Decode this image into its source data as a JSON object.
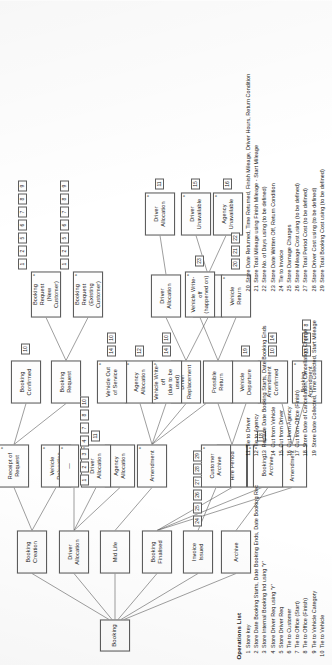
{
  "diagram": {
    "root": {
      "label": "Booking"
    },
    "nodes": [
      {
        "id": "booking",
        "label": "Booking",
        "star": false
      },
      {
        "id": "booking-creation",
        "label": "Booking\nCreation",
        "star": false
      },
      {
        "id": "mid-life",
        "label": "Mid Life",
        "star": false
      },
      {
        "id": "booking-finalised",
        "label": "Booking\nFinalised",
        "star": false
      },
      {
        "id": "invoice-issued",
        "label": "Invoice\nIssued",
        "star": false
      },
      {
        "id": "archive",
        "label": "Archive",
        "star": false
      },
      {
        "id": "vehicle-relocation",
        "label": "Vehicle\nRelocation",
        "star": true
      },
      {
        "id": "receipt-of-request",
        "label": "Receipt of\nRequest",
        "star": true
      },
      {
        "id": "booking-request",
        "label": "Booking\nRequest",
        "star": false
      },
      {
        "id": "booking-confirmed",
        "label": "Booking\nConfirmed",
        "star": false
      },
      {
        "id": "booking-request-new",
        "label": "Booking Request\n(New Customer)",
        "star": true
      },
      {
        "id": "booking-request-exist",
        "label": "Booking Request\n(Existing Customer)",
        "star": true
      },
      {
        "id": "agency-allocation-top",
        "label": "Agency\nAllocation",
        "star": true
      },
      {
        "id": "driver-allocation-top",
        "label": "Driver\nAllocation",
        "star": false
      },
      {
        "id": "driver-allocation-1",
        "label": "Driver\nAllocation",
        "star": true
      },
      {
        "id": "dash-node",
        "label": "—",
        "star": true
      },
      {
        "id": "agency-allocation-2",
        "label": "Agency\nAllocation",
        "star": true
      },
      {
        "id": "driver-replacement",
        "label": "Driver\nReplacement",
        "star": true
      },
      {
        "id": "driver-allocation-3",
        "label": "Driver\nAllocation",
        "star": false
      },
      {
        "id": "driver-allocation-4",
        "label": "Driver\nAllocation",
        "star": true
      },
      {
        "id": "driver-unavailable-1",
        "label": "Driver\nUnavailable",
        "star": false
      },
      {
        "id": "driver-unavailable-2",
        "label": "Driver\nUnavailable",
        "star": true
      },
      {
        "id": "agency-unavailable",
        "label": "Agency\nUnavailable",
        "star": true
      },
      {
        "id": "amendment-mid",
        "label": "Amendment",
        "star": true
      },
      {
        "id": "vehicle-writeoff-due",
        "label": "Vehicle Write-off\n(due to be used)",
        "star": true
      },
      {
        "id": "vehicle-out-service",
        "label": "Vehicle Out\nof Service",
        "star": true
      },
      {
        "id": "booking-cancellation",
        "label": "Booking\nCancellation",
        "star": true
      },
      {
        "id": "amendment-fin",
        "label": "Amendment",
        "star": true
      },
      {
        "id": "booking-amendment",
        "label": "Booking\nAmendment",
        "star": true
      },
      {
        "id": "amendment-confirmed",
        "label": "Amendment\nConfirmed",
        "star": false
      },
      {
        "id": "hire-period",
        "label": "Hire Period",
        "star": true
      },
      {
        "id": "vehicle-departure",
        "label": "Vehicle\nDeparture",
        "star": false
      },
      {
        "id": "possible-return",
        "label": "Possible\nReturn",
        "star": false
      },
      {
        "id": "vehicle-return",
        "label": "Vehicle\nReturn",
        "star": true
      },
      {
        "id": "vehicle-writeoff-happened",
        "label": "Vehicle Write-off\n(happened on)",
        "star": true
      },
      {
        "id": "customer-archive",
        "label": "Customer\nArchive",
        "star": true
      },
      {
        "id": "booking-archive",
        "label": "Booking\nArchive",
        "star": true
      }
    ],
    "operation_refs": {
      "vehicle-relocation": [
        "1",
        "2",
        "3",
        "4",
        "7",
        "8",
        "10"
      ],
      "booking-request-new": [
        "1",
        "2",
        "5",
        "6",
        "7",
        "8",
        "9"
      ],
      "booking-request-exist": [
        "1",
        "2",
        "5",
        "6",
        "7",
        "8",
        "9"
      ],
      "booking-confirmed": [
        "10"
      ],
      "driver-allocation-1": [
        "11"
      ],
      "agency-allocation-2": [
        "12"
      ],
      "driver-allocation-4": [
        "11"
      ],
      "driver-unavailable-2": [
        "15"
      ],
      "agency-unavailable": [
        "16"
      ],
      "vehicle-writeoff-due": [
        "14",
        "10"
      ],
      "vehicle-out-service": [
        "14",
        "10"
      ],
      "booking-cancellation": [
        "18"
      ],
      "booking-amendment": [
        "13",
        "17",
        "8"
      ],
      "amendment-confirmed": [
        "10",
        "14"
      ],
      "vehicle-departure": [
        "19"
      ],
      "vehicle-return": [
        "20",
        "21",
        "22"
      ],
      "vehicle-writeoff-happened": [
        "23"
      ],
      "invoice-issued": [
        "24",
        "25",
        "26",
        "27",
        "28",
        "29"
      ]
    }
  },
  "operations": {
    "title": "Operations List",
    "items": [
      {
        "num": "1",
        "text": "Store key"
      },
      {
        "num": "2",
        "text": "Store Date Booking Starts, Date Booking Ends, Date Booking Rec"
      },
      {
        "num": "3",
        "text": "Store Internal Booking Ind using 'Y'"
      },
      {
        "num": "4",
        "text": "Store Driver Req using 'Y'"
      },
      {
        "num": "5",
        "text": "Store Driver Req"
      },
      {
        "num": "6",
        "text": "Tie to Customer"
      },
      {
        "num": "7",
        "text": "Tie to Office (Start)"
      },
      {
        "num": "8",
        "text": "Tie to Office (Finish)"
      },
      {
        "num": "9",
        "text": "Tie to Vehicle Category"
      },
      {
        "num": "10",
        "text": "Tie to Vehicle"
      },
      {
        "num": "11",
        "text": "Tie to Driver"
      },
      {
        "num": "12",
        "text": "Tie to Agency"
      },
      {
        "num": "13",
        "text": "Replace Date Booking Starts, Date Booking Ends"
      },
      {
        "num": "14",
        "text": "Cut from Vehicle"
      },
      {
        "num": "15",
        "text": "Cut from Driver"
      },
      {
        "num": "16",
        "text": "Cut from Agency"
      },
      {
        "num": "17",
        "text": "Cut from Office (Finish)"
      },
      {
        "num": "18",
        "text": "Store Date of Cancellation, Cancellation Charge"
      },
      {
        "num": "19",
        "text": "Store Date Collected, Time Collected, Start Mileage"
      },
      {
        "num": "20",
        "text": "Store Date Returned, Time Returned, Finish Mileage, Driver Hours, Return Condition"
      },
      {
        "num": "21",
        "text": "Store Total Mileage using Finish Mileage - Start Mileage"
      },
      {
        "num": "22",
        "text": "Store No. of Days using (to be defined)"
      },
      {
        "num": "23",
        "text": "Store Date Written Off, Return Condition"
      },
      {
        "num": "24",
        "text": "Tie to Invoice"
      },
      {
        "num": "25",
        "text": "Store Damage Charges"
      },
      {
        "num": "26",
        "text": "Store Mileage Cost using (to be defined)"
      },
      {
        "num": "27",
        "text": "Store Total Period Cost (to be defined)"
      },
      {
        "num": "28",
        "text": "Store Driver Cost using (to be defined)"
      },
      {
        "num": "29",
        "text": "Store Total Booking Cost using (to be defined)"
      }
    ],
    "columns": [
      [
        0,
        10
      ],
      [
        10,
        19
      ],
      [
        19,
        29
      ]
    ]
  },
  "style": {
    "line_color": "#5d5d5d",
    "text_color": "#1b1b1b",
    "box_fill": "#fdfdfd"
  }
}
